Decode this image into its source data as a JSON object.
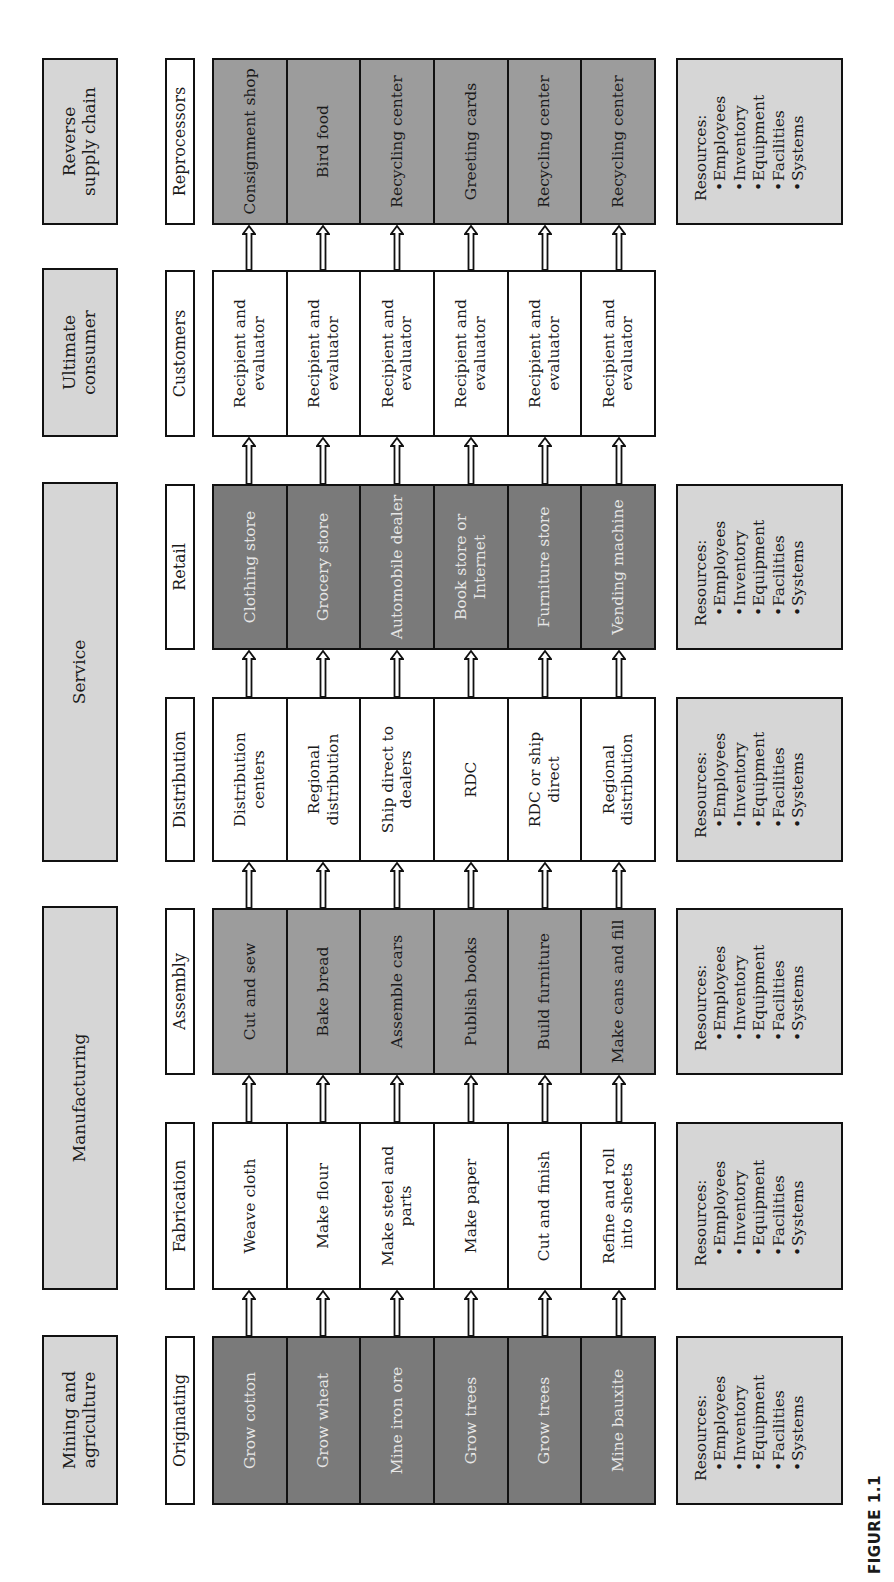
{
  "figure_label": "FIGURE 1.1",
  "resources": {
    "title": "Resources:",
    "items": [
      "Employees",
      "Inventory",
      "Equipment",
      "Facilities",
      "Systems"
    ]
  },
  "sectors": [
    {
      "label": "Mining and agriculture",
      "x": 77,
      "w": 170
    },
    {
      "label": "Manufacturing",
      "x": 292,
      "w": 384
    },
    {
      "label": "Service",
      "x": 720,
      "w": 380
    },
    {
      "label": "Ultimate consumer",
      "x": 1145,
      "w": 169
    },
    {
      "label": "Reverse supply chain",
      "x": 1357,
      "w": 167
    }
  ],
  "stages": [
    {
      "label": "Originating",
      "x": 77,
      "w": 169,
      "shade": "dark",
      "has_resources": true,
      "cells": [
        "Grow cotton",
        "Grow wheat",
        "Mine iron ore",
        "Grow trees",
        "Grow trees",
        "Mine bauxite"
      ]
    },
    {
      "label": "Fabrication",
      "x": 292,
      "w": 168,
      "shade": "white",
      "has_resources": true,
      "cells": [
        "Weave cloth",
        "Make flour",
        "Make steel and parts",
        "Make paper",
        "Cut and finish",
        "Refine and roll into sheets"
      ]
    },
    {
      "label": "Assembly",
      "x": 507,
      "w": 167,
      "shade": "mid",
      "has_resources": true,
      "cells": [
        "Cut and sew",
        "Bake bread",
        "Assemble cars",
        "Publish books",
        "Build furniture",
        "Make cans and fill"
      ]
    },
    {
      "label": "Distribution",
      "x": 720,
      "w": 165,
      "shade": "white",
      "has_resources": true,
      "cells": [
        "Distribution centers",
        "Regional distribution",
        "Ship direct to dealers",
        "RDC",
        "RDC or ship direct",
        "Regional distribution"
      ]
    },
    {
      "label": "Retail",
      "x": 932,
      "w": 166,
      "shade": "dark",
      "has_resources": true,
      "cells": [
        "Clothing store",
        "Grocery store",
        "Automobile dealer",
        "Book store or Internet",
        "Furniture store",
        "Vending machine"
      ]
    },
    {
      "label": "Customers",
      "x": 1145,
      "w": 167,
      "shade": "white",
      "has_resources": false,
      "cells": [
        "Recipient and evaluator",
        "Recipient and evaluator",
        "Recipient and evaluator",
        "Recipient and evaluator",
        "Recipient and evaluator",
        "Recipient and evaluator"
      ]
    },
    {
      "label": "Reprocessors",
      "x": 1357,
      "w": 167,
      "shade": "mid",
      "has_resources": true,
      "cells": [
        "Consignment shop",
        "Bird food",
        "Recycling center",
        "Greeting cards",
        "Recycling center",
        "Recycling center"
      ]
    }
  ],
  "colors": {
    "sector_fill": "#d6d6d6",
    "dark_fill": "#7a7a7a",
    "mid_fill": "#9c9c9c",
    "white_fill": "#ffffff",
    "border": "#111111"
  }
}
